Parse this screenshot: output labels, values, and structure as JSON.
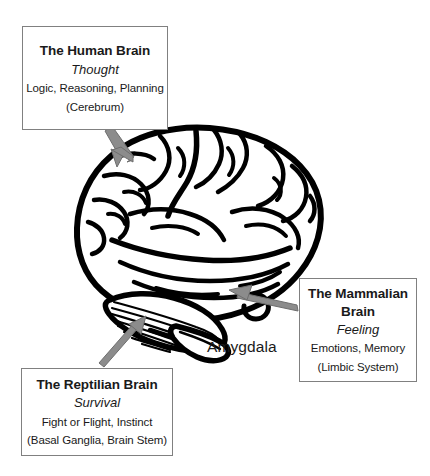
{
  "diagram": {
    "background_color": "#ffffff",
    "line_color": "#000000",
    "arrow_color": "#808080",
    "box_border_color": "#808080",
    "text_color": "#1a1a1a"
  },
  "callouts": [
    {
      "id": "human",
      "title": "The Human Brain",
      "subtitle": "Thought",
      "detail": "Logic, Reasoning, Planning",
      "region": "(Cerebrum)",
      "points_to": "cerebrum"
    },
    {
      "id": "mammalian",
      "title": "The Mammalian\nBrain",
      "subtitle": "Feeling",
      "detail": "Emotions, Memory",
      "region": "(Limbic System)",
      "points_to": "amygdala"
    },
    {
      "id": "reptilian",
      "title": "The Reptilian Brain",
      "subtitle": "Survival",
      "detail": "Fight or Flight, Instinct",
      "region": "(Basal Ganglia, Brain Stem)",
      "points_to": "cerebellum-brainstem"
    }
  ],
  "annotations": {
    "amygdala_label": "Amygdala"
  },
  "illustration": {
    "name": "brain-lateral-view",
    "parts": [
      "cerebrum",
      "cerebellum",
      "brain-stem"
    ]
  }
}
